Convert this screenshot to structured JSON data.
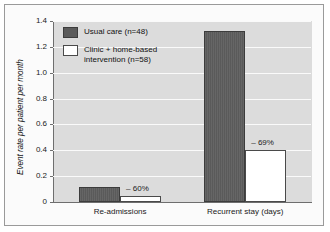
{
  "chart_data": {
    "type": "bar",
    "title": "",
    "xlabel": "",
    "ylabel": "Event rate per patient per month",
    "ylim": [
      0,
      1.4
    ],
    "categories": [
      "Re-admissions",
      "Recurrent stay (days)"
    ],
    "series": [
      {
        "name": "Usual care (n=48)",
        "values": [
          0.12,
          1.32
        ],
        "color": "#5a5a5a"
      },
      {
        "name": "Clinic + home-based intervention (n=58)",
        "values": [
          0.05,
          0.405
        ],
        "color": "#ffffff"
      }
    ],
    "annotations": [
      "– 60%",
      "– 69%"
    ],
    "y_ticks": [
      "1.4",
      "1.2",
      "1.0",
      "0.8",
      "0.6",
      "0.4",
      "0.2",
      "0"
    ],
    "y_tick_values": [
      1.4,
      1.2,
      1.0,
      0.8,
      0.6,
      0.4,
      0.2,
      0
    ],
    "grid": true,
    "legend_position": "top-left-inside"
  },
  "legend": {
    "items": [
      {
        "label": "Usual care (n=48)",
        "swatch": "dark"
      },
      {
        "label": "Clinic + home-based\nintervention (n=58)",
        "swatch": "light"
      }
    ]
  },
  "axis": {
    "y_title": "Event rate per patient per month",
    "y_labels": [
      "1.4",
      "1.2",
      "1.0",
      "0.8",
      "0.6",
      "0.4",
      "0.2",
      "0"
    ],
    "x_labels": [
      "Re-admissions",
      "Recurrent stay (days)"
    ]
  },
  "annotations": {
    "group1": "– 60%",
    "group2": "– 69%"
  },
  "colors": {
    "bar_dark": "#5a5a5a",
    "bar_light": "#ffffff",
    "plot_background": "#dcdcdc",
    "gridline": "#fafafa",
    "frame": "#9a9a9a",
    "axis": "#6e6e6e"
  }
}
